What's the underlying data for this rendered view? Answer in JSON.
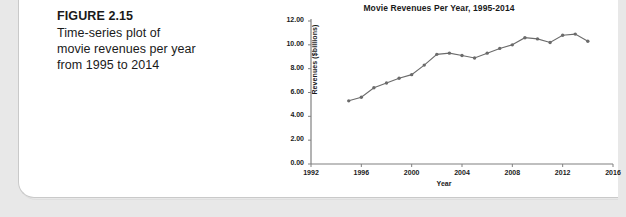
{
  "figure": {
    "number_label": "FIGURE 2.15",
    "caption_lines": [
      "Time-series plot of",
      "movie revenues per year",
      "from 1995 to 2014"
    ]
  },
  "chart_data": {
    "type": "line",
    "title": "Movie Revenues Per Year, 1995-2014",
    "xlabel": "Year",
    "ylabel": "Revenues ($billions)",
    "xlim": [
      1992,
      2016
    ],
    "ylim": [
      0.0,
      12.0
    ],
    "xticks": [
      "1992",
      "1996",
      "2000",
      "2004",
      "2008",
      "2012",
      "2016"
    ],
    "xtick_values": [
      1992,
      1996,
      2000,
      2004,
      2008,
      2012,
      2016
    ],
    "yticks": [
      "0.00",
      "2.00",
      "4.00",
      "6.00",
      "8.00",
      "10.00",
      "12.00"
    ],
    "ytick_values": [
      0.0,
      2.0,
      4.0,
      6.0,
      8.0,
      10.0,
      12.0
    ],
    "grid": false,
    "legend": null,
    "marker": "filled-circle",
    "series_color": "#6b6b6b",
    "x": [
      1995,
      1996,
      1997,
      1998,
      1999,
      2000,
      2001,
      2002,
      2003,
      2004,
      2005,
      2006,
      2007,
      2008,
      2009,
      2010,
      2011,
      2012,
      2013,
      2014
    ],
    "values": [
      5.3,
      5.6,
      6.4,
      6.8,
      7.2,
      7.5,
      8.3,
      9.2,
      9.3,
      9.1,
      8.9,
      9.3,
      9.7,
      10.0,
      10.6,
      10.5,
      10.2,
      10.8,
      10.9,
      10.3
    ],
    "series": [
      {
        "name": "Revenues ($billions)",
        "values": [
          5.3,
          5.6,
          6.4,
          6.8,
          7.2,
          7.5,
          8.3,
          9.2,
          9.3,
          9.1,
          8.9,
          9.3,
          9.7,
          10.0,
          10.6,
          10.5,
          10.2,
          10.8,
          10.9,
          10.3
        ]
      }
    ]
  }
}
